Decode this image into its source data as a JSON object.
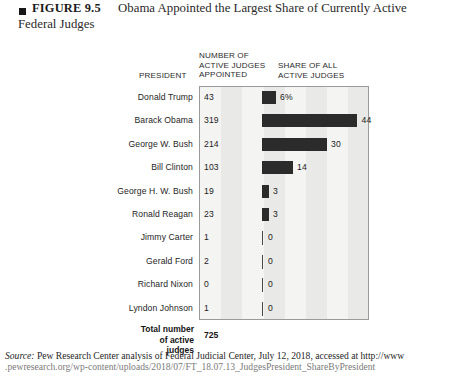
{
  "figure": {
    "label": "FIGURE 9.5",
    "title_line1": "Obama Appointed the Largest Share of Currently Active",
    "title_line2": "Federal Judges",
    "bullet_icon": "black-square-bullet"
  },
  "headers": {
    "president": "PRESIDENT",
    "number": "NUMBER OF\nACTIVE JUDGES\nAPPOINTED",
    "share": "SHARE OF ALL\nACTIVE JUDGES"
  },
  "total": {
    "label_line1": "Total number",
    "label_line2": "of active judges",
    "value": "725"
  },
  "source": {
    "prefix": "Source:",
    "line1": " Pew Research Center analysis of Federal Judicial Center, July 12, 2018, accessed at http://www",
    "line2": ".pewresearch.org/wp-content/uploads/2018/07/FT_18.07.13_JudgesPresident_ShareByPresident"
  },
  "colors": {
    "bar": "#2b2b2b",
    "plot_background": "#f0f0ef",
    "band_light": "#f4f4f3",
    "band_dark": "#e9e9e7",
    "plot_border": "#9a9a9a"
  },
  "chart_data": {
    "type": "bar",
    "title": "Obama Appointed the Largest Share of Currently Active Federal Judges",
    "xlabel": "Share of all active judges",
    "ylabel": "President",
    "orientation": "horizontal",
    "grid": true,
    "legend": false,
    "xlim": [
      0,
      50
    ],
    "categories": [
      "Donald Trump",
      "Barack Obama",
      "George W. Bush",
      "Bill Clinton",
      "George H. W. Bush",
      "Ronald Reagan",
      "Jimmy Carter",
      "Gerald Ford",
      "Richard Nixon",
      "Lyndon Johnson"
    ],
    "series": [
      {
        "name": "Number of active judges appointed",
        "values": [
          43,
          319,
          214,
          103,
          19,
          23,
          1,
          2,
          0,
          1
        ],
        "display": [
          "43",
          "319",
          "214",
          "103",
          "19",
          "23",
          "1",
          "2",
          "0",
          "1"
        ]
      },
      {
        "name": "Share of all active judges",
        "values": [
          6,
          44,
          30,
          14,
          3,
          3,
          0,
          0,
          0,
          0
        ],
        "display": [
          "6%",
          "44",
          "30",
          "14",
          "3",
          "3",
          "0",
          "0",
          "0",
          "0"
        ]
      }
    ],
    "total_active_judges": 725
  },
  "rows": [
    {
      "president": "Donald Trump",
      "count": "43",
      "share_label": "6%",
      "bar_width": 13.5,
      "zero": false
    },
    {
      "president": "Barack Obama",
      "count": "319",
      "share_label": "44",
      "bar_width": 95.0,
      "zero": false
    },
    {
      "president": "George W. Bush",
      "count": "214",
      "share_label": "30",
      "bar_width": 64.5,
      "zero": false
    },
    {
      "president": "Bill Clinton",
      "count": "103",
      "share_label": "14",
      "bar_width": 30.5,
      "zero": false
    },
    {
      "president": "George H. W. Bush",
      "count": "19",
      "share_label": "3",
      "bar_width": 6.5,
      "zero": false
    },
    {
      "president": "Ronald Reagan",
      "count": "23",
      "share_label": "3",
      "bar_width": 6.5,
      "zero": false
    },
    {
      "president": "Jimmy Carter",
      "count": "1",
      "share_label": "0",
      "bar_width": 0,
      "zero": true
    },
    {
      "president": "Gerald Ford",
      "count": "2",
      "share_label": "0",
      "bar_width": 0,
      "zero": true
    },
    {
      "president": "Richard Nixon",
      "count": "0",
      "share_label": "0",
      "bar_width": 0,
      "zero": true
    },
    {
      "president": "Lyndon Johnson",
      "count": "1",
      "share_label": "0",
      "bar_width": 0,
      "zero": true
    }
  ]
}
